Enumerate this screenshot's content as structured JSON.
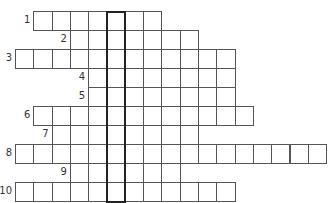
{
  "puzzle": {
    "type": "crossword",
    "cell_width": 18.3,
    "cell_height": 19,
    "origin_x": 15,
    "origin_y": 11,
    "highlight_column": 5,
    "rows": [
      {
        "number": "1",
        "start_col": 1,
        "end_col": 7
      },
      {
        "number": "2",
        "start_col": 3,
        "end_col": 9
      },
      {
        "number": "3",
        "start_col": 0,
        "end_col": 11
      },
      {
        "number": "4",
        "start_col": 4,
        "end_col": 11
      },
      {
        "number": "5",
        "start_col": 4,
        "end_col": 11
      },
      {
        "number": "6",
        "start_col": 1,
        "end_col": 12
      },
      {
        "number": "7",
        "start_col": 2,
        "end_col": 9
      },
      {
        "number": "8",
        "start_col": 0,
        "end_col": 16
      },
      {
        "number": "9",
        "start_col": 3,
        "end_col": 8
      },
      {
        "number": "10",
        "start_col": 0,
        "end_col": 11
      }
    ]
  },
  "colors": {
    "grid_line": "#555555",
    "highlight_border": "#222222",
    "number_text": "#333333",
    "background": "#ffffff"
  }
}
